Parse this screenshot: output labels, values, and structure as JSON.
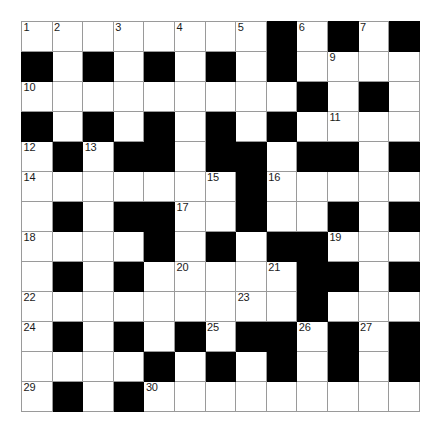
{
  "puzzle": {
    "kind": "crossword-grid",
    "rows": 13,
    "cols": 13,
    "cell_size_px": 30.6,
    "colors": {
      "block": "#000000",
      "open": "#ffffff",
      "gridline": "#9a9a9a",
      "border": "#7a7a7a",
      "number_text": "#1a1a1a"
    },
    "legend": {
      "open_cell": ".",
      "block_cell": "#"
    },
    "grid": [
      "........#.#.#",
      "#.#.#.#.#....",
      ".........#.#.",
      "#.#.#.#.#....",
      ".#.##.##.##.#",
      ".......#.....",
      ".#.##..#..#.#",
      "....#.#.##...",
      ".#.#.....##.#",
      ".........#...",
      ".#.#.#.##.#.#",
      "....#.#.#.#.#",
      ".#.#........."
    ],
    "numbers": [
      {
        "number": "1",
        "row": 1,
        "col": 1
      },
      {
        "number": "2",
        "row": 1,
        "col": 2
      },
      {
        "number": "3",
        "row": 1,
        "col": 4
      },
      {
        "number": "4",
        "row": 1,
        "col": 6
      },
      {
        "number": "5",
        "row": 1,
        "col": 8
      },
      {
        "number": "6",
        "row": 1,
        "col": 10
      },
      {
        "number": "7",
        "row": 1,
        "col": 12
      },
      {
        "number": "8",
        "row": 1,
        "col": 13
      },
      {
        "number": "9",
        "row": 2,
        "col": 11
      },
      {
        "number": "10",
        "row": 3,
        "col": 1
      },
      {
        "number": "11",
        "row": 4,
        "col": 11
      },
      {
        "number": "12",
        "row": 5,
        "col": 1
      },
      {
        "number": "13",
        "row": 5,
        "col": 3
      },
      {
        "number": "14",
        "row": 6,
        "col": 1
      },
      {
        "number": "15",
        "row": 6,
        "col": 7
      },
      {
        "number": "16",
        "row": 6,
        "col": 9
      },
      {
        "number": "17",
        "row": 7,
        "col": 6
      },
      {
        "number": "18",
        "row": 8,
        "col": 1
      },
      {
        "number": "19",
        "row": 8,
        "col": 11
      },
      {
        "number": "20",
        "row": 9,
        "col": 6
      },
      {
        "number": "21",
        "row": 9,
        "col": 9
      },
      {
        "number": "22",
        "row": 10,
        "col": 1
      },
      {
        "number": "23",
        "row": 10,
        "col": 8
      },
      {
        "number": "24",
        "row": 11,
        "col": 1
      },
      {
        "number": "25",
        "row": 11,
        "col": 7
      },
      {
        "number": "26",
        "row": 11,
        "col": 10
      },
      {
        "number": "27",
        "row": 11,
        "col": 12
      },
      {
        "number": "28",
        "row": 12,
        "col": 5
      },
      {
        "number": "29",
        "row": 13,
        "col": 1
      },
      {
        "number": "30",
        "row": 13,
        "col": 5
      }
    ]
  }
}
